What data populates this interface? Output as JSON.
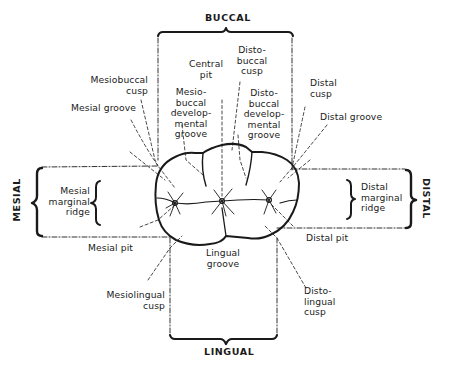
{
  "figure": {
    "surfaces": {
      "top": "BUCCAL",
      "bottom": "LINGUAL",
      "left": "MESIAL",
      "right": "DISTAL"
    },
    "labels": {
      "central_pit": "Central\npit",
      "disto_buccal_cusp": "Disto-\nbuccal\ncusp",
      "mesiobuccal_cusp": "Mesiobuccal\ncusp",
      "mesial_groove": "Mesial groove",
      "mesio_buccal_dev_groove": "Mesio-\nbuccal\ndevelop-\nmental\ngroove",
      "disto_buccal_dev_groove": "Disto-\nbuccal\ndevelop-\nmental\ngroove",
      "distal_cusp": "Distal\ncusp",
      "distal_groove": "Distal groove",
      "mesial_marginal_ridge": "Mesial\nmarginal\nridge",
      "distal_marginal_ridge": "Distal\nmarginal\nridge",
      "mesial_pit": "Mesial pit",
      "distal_pit": "Distal pit",
      "lingual_groove": "Lingual\ngroove",
      "mesiolingual_cusp": "Mesiolingual\ncusp",
      "disto_lingual_cusp": "Disto-\nlingual\ncusp"
    },
    "colors": {
      "ink": "#1a1a1a",
      "background": "#ffffff"
    }
  }
}
